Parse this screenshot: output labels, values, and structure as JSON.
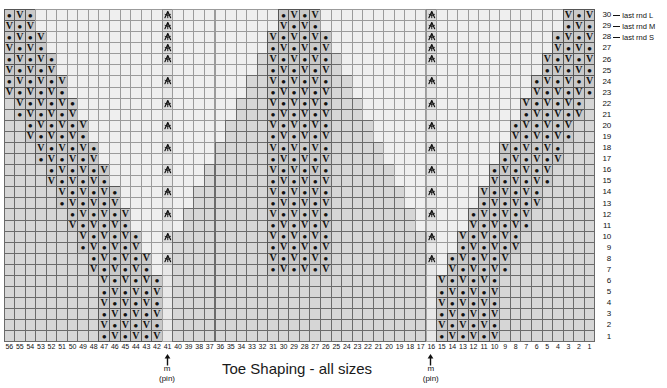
{
  "title": "Toe Shaping - all sizes",
  "legend": {
    "items": [
      {
        "row": "30",
        "label": "last rnd L"
      },
      {
        "row": "29",
        "label": "last rnd M"
      },
      {
        "row": "28",
        "label": "last rnd S"
      }
    ]
  },
  "markers": [
    {
      "label": "m",
      "sub": "(pin)",
      "at_col": 41
    },
    {
      "label": "m",
      "sub": "(pin)",
      "at_col": 16
    }
  ],
  "axes": {
    "rows_top": 30,
    "rows_bottom": 1,
    "row_labels": [
      "30",
      "29",
      "28",
      "27",
      "26",
      "25",
      "24",
      "23",
      "22",
      "21",
      "20",
      "19",
      "18",
      "17",
      "16",
      "15",
      "14",
      "13",
      "12",
      "11",
      "10",
      "9",
      "8",
      "7",
      "6",
      "5",
      "4",
      "3",
      "2",
      "1"
    ],
    "col_labels": [
      "56",
      "55",
      "54",
      "53",
      "52",
      "51",
      "50",
      "49",
      "48",
      "47",
      "46",
      "45",
      "44",
      "43",
      "42",
      "41",
      "40",
      "39",
      "38",
      "37",
      "36",
      "35",
      "34",
      "33",
      "32",
      "31",
      "30",
      "29",
      "28",
      "27",
      "26",
      "25",
      "24",
      "23",
      "22",
      "21",
      "20",
      "19",
      "18",
      "17",
      "16",
      "15",
      "14",
      "13",
      "12",
      "11",
      "10",
      "9",
      "8",
      "7",
      "6",
      "5",
      "4",
      "3",
      "2",
      "1"
    ]
  },
  "symbols": {
    "knit_dot": "•",
    "slip_v": "V",
    "decrease": "centered-double-decrease"
  },
  "colors": {
    "empty": "#efefef",
    "worked": "#d6d6d6",
    "symbol_cell": "#c9c9c9",
    "marker_col": "#dcdcdc",
    "grid_line": "#6a6a6a",
    "text": "#111111"
  },
  "chart_data": {
    "type": "table",
    "title": "Toe Shaping - all sizes",
    "cols": 56,
    "rows": 30,
    "marker_cols": [
      41,
      16
    ],
    "note": "Knitting toe-shaping chart. Three stepped pyramid blocks of worked stitches separated by two marker (pin) columns showing centered-double-decrease symbols. Worked cells alternate dot (knit) and V (slip) in a checker pattern.",
    "legend_rows": {
      "30": "last rnd L",
      "29": "last rnd M",
      "28": "last rnd S"
    }
  }
}
